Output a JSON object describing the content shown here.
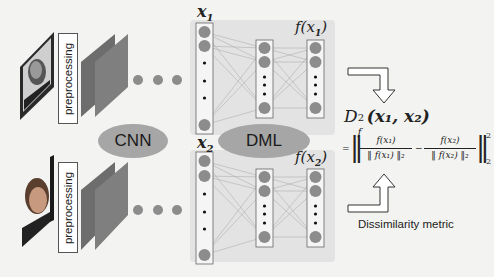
{
  "diagram": {
    "colors": {
      "background": "#f3f3f1",
      "panel": "#e3e3e3",
      "node": "#8c8c8c",
      "layer_front": "#7d7d7d",
      "layer_back": "#666666",
      "ellipse": "#a6a6a6",
      "line": "#b0b0b0"
    },
    "branches": [
      {
        "id": "top",
        "image_label": "face-image-1",
        "preprocessing_label": "preprocessing",
        "input_label": "x",
        "input_sub": "1",
        "output_label": "f(x",
        "output_sub": "1",
        "output_close": ")"
      },
      {
        "id": "bottom",
        "image_label": "face-image-2",
        "preprocessing_label": "preprocessing",
        "input_label": "x",
        "input_sub": "2",
        "output_label": "f(x",
        "output_sub": "2",
        "output_close": ")"
      }
    ],
    "modules": {
      "cnn_label": "CNN",
      "dml_label": "DML"
    },
    "metric": {
      "lhs": "D",
      "lhs_sub": "f",
      "lhs_sup": "2",
      "lhs_args": "(x₁, x₂)",
      "equals": "=",
      "frac1_num": "f(x₁)",
      "frac1_den": "‖ f(x₁) ‖₂",
      "minus": "−",
      "frac2_num": "f(x₂)",
      "frac2_den": "‖ f(x₂) ‖₂",
      "norm_sup": "2",
      "norm_sub": "2",
      "caption": "Dissimilarity metric"
    }
  }
}
